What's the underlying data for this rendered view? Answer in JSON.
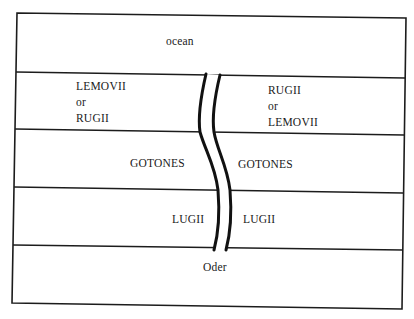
{
  "diagram": {
    "title": "",
    "bands": [
      {
        "id": "ocean",
        "labels": {
          "center": "ocean"
        }
      },
      {
        "id": "band1",
        "left": [
          "LEMOVII",
          "or",
          "RUGII"
        ],
        "right": [
          "RUGII",
          "or",
          "LEMOVII"
        ]
      },
      {
        "id": "band2",
        "left": [
          "GOTONES"
        ],
        "right": [
          "GOTONES"
        ]
      },
      {
        "id": "band3",
        "left": [
          "LUGII"
        ],
        "right": [
          "LUGII"
        ]
      },
      {
        "id": "band4",
        "left": [],
        "right": []
      }
    ],
    "river": {
      "label": "Oder"
    },
    "colors": {
      "line": "#1c1c1c",
      "background": "#ffffff",
      "text": "#1a1a1a"
    }
  }
}
